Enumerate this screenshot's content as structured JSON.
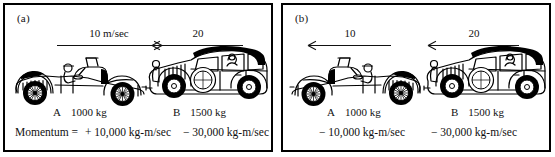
{
  "figure": {
    "background_color": "#ffffff",
    "ink_color": "#000000",
    "panel_count": 2
  },
  "panels": [
    {
      "label": "(a)",
      "name": "panel-a",
      "cars": [
        {
          "id": "car-a",
          "name_label": "A",
          "mass_label": "1000 kg",
          "type": "roadster-convertible",
          "facing": "right",
          "roof_color": "#ffffff",
          "velocity": {
            "label": "10 m/sec",
            "direction": "right"
          },
          "momentum_label": "+ 10,000 kg-m/sec"
        },
        {
          "id": "car-b",
          "name_label": "B",
          "mass_label": "1500 kg",
          "type": "sedan",
          "facing": "left",
          "roof_color": "#000000",
          "velocity": {
            "label": "20",
            "direction": "left"
          },
          "momentum_label": "− 30,000 kg-m/sec"
        }
      ],
      "footer_prefix": "Momentum  =",
      "footer_left": "+ 10,000 kg-m/sec",
      "footer_right": "− 30,000 kg-m/sec"
    },
    {
      "label": "(b)",
      "name": "panel-b",
      "cars": [
        {
          "id": "car-a",
          "name_label": "A",
          "mass_label": "1000 kg",
          "type": "roadster-convertible",
          "facing": "left",
          "roof_color": "#ffffff",
          "velocity": {
            "label": "10",
            "direction": "left"
          },
          "momentum_label": "− 10,000 kg-m/sec"
        },
        {
          "id": "car-b",
          "name_label": "B",
          "mass_label": "1500 kg",
          "type": "sedan",
          "facing": "left",
          "roof_color": "#000000",
          "velocity": {
            "label": "20",
            "direction": "left"
          },
          "momentum_label": "− 30,000 kg-m/sec"
        }
      ],
      "footer_prefix": "",
      "footer_left": "− 10,000 kg-m/sec",
      "footer_right": "− 30,000 kg-m/sec"
    }
  ]
}
